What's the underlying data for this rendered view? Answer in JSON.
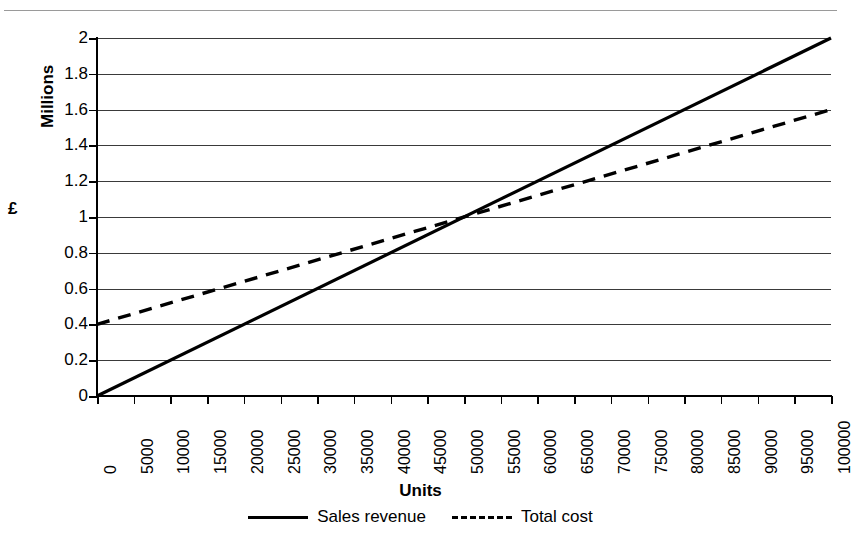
{
  "chart_data": {
    "type": "line",
    "title": "",
    "xlabel": "Units",
    "ylabel": "£",
    "y_unit_caption": "Millions",
    "grid": true,
    "legend_position": "bottom",
    "xlim": [
      0,
      100000
    ],
    "ylim": [
      0,
      2
    ],
    "x_tick_labels": [
      "0",
      "5000",
      "10000",
      "15000",
      "20000",
      "25000",
      "30000",
      "35000",
      "40000",
      "45000",
      "50000",
      "55000",
      "60000",
      "65000",
      "70000",
      "75000",
      "80000",
      "85000",
      "90000",
      "95000",
      "100000"
    ],
    "x_ticks": [
      0,
      5000,
      10000,
      15000,
      20000,
      25000,
      30000,
      35000,
      40000,
      45000,
      50000,
      55000,
      60000,
      65000,
      70000,
      75000,
      80000,
      85000,
      90000,
      95000,
      100000
    ],
    "y_tick_labels": [
      "2",
      "1.8",
      "1.6",
      "1.4",
      "1.2",
      "1",
      "0.8",
      "0.6",
      "0.4",
      "0.2",
      "0"
    ],
    "y_ticks": [
      2,
      1.8,
      1.6,
      1.4,
      1.2,
      1,
      0.8,
      0.6,
      0.4,
      0.2,
      0
    ],
    "x": [
      0,
      100000
    ],
    "series": [
      {
        "name": "Sales revenue",
        "style": "solid",
        "color": "#000000",
        "values": [
          0,
          2.0
        ]
      },
      {
        "name": "Total cost",
        "style": "dashed",
        "color": "#000000",
        "values": [
          0.4,
          1.6
        ]
      }
    ],
    "breakeven": {
      "units": 50000,
      "value": 1.0
    }
  },
  "legend": {
    "items": [
      {
        "label": "Sales revenue",
        "style": "solid"
      },
      {
        "label": "Total cost",
        "style": "dashed"
      }
    ]
  }
}
